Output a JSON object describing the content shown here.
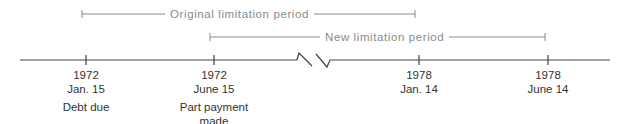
{
  "diagram": {
    "periods": [
      {
        "label": "Original limitation period",
        "start_x": 82,
        "end_x": 415,
        "y": 14
      },
      {
        "label": "New limitation period",
        "start_x": 210,
        "end_x": 545,
        "y": 37
      }
    ],
    "events": [
      {
        "year": "1972",
        "date": "Jan. 15",
        "note": "Debt due",
        "x": 86
      },
      {
        "year": "1972",
        "date": "June 15",
        "note": "Part payment made",
        "note_line1": "Part payment",
        "note_line2": "made",
        "x": 214
      },
      {
        "year": "1978",
        "date": "Jan. 14",
        "note": "",
        "x": 419
      },
      {
        "year": "1978",
        "date": "June 14",
        "note": "",
        "x": 548
      }
    ],
    "timeline_break": "axis break between 1972 and 1978",
    "colors": {
      "axis": "#444444",
      "period_lines": "#8a8a8a",
      "text": "#333333"
    }
  }
}
